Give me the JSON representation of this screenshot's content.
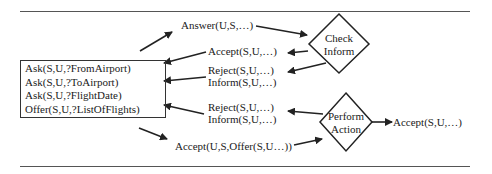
{
  "diagram": {
    "nodes": {
      "check_inform": {
        "label_line1": "Check",
        "label_line2": "Inform"
      },
      "perform_action": {
        "label_line1": "Perform",
        "label_line2": "Action"
      }
    },
    "box": {
      "lines": [
        "Ask(S,U,?FromAirport)",
        "Ask(S,U,?ToAirport)",
        "Ask(S,U,?FlightDate)",
        "Offer(S,U,?ListOfFlights)"
      ]
    },
    "labels": {
      "answer": "Answer(U,S,…)",
      "accept1": "Accept(S,U,…)",
      "reject1": "Reject(S,U,…)",
      "inform1": "Inform(S,U,…)",
      "reject2": "Reject(S,U,…)",
      "inform2": "Inform(S,U,…)",
      "accept_offer": "Accept(U,S,Offer(S,U…))",
      "accept_out": "Accept(S,U,…)"
    }
  }
}
